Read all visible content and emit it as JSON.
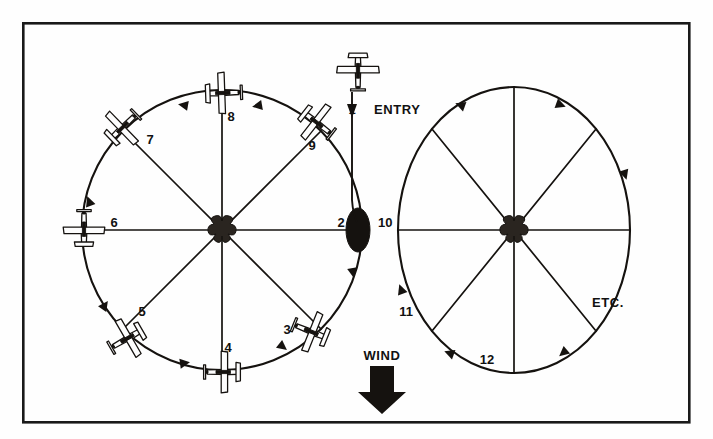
{
  "figure": {
    "background_color": "#fefefe",
    "ink_color": "#15120f",
    "frame": {
      "x": 22,
      "y": 22,
      "width": 668,
      "height": 401
    }
  },
  "labels": {
    "entry": "ENTRY",
    "wind": "WIND",
    "etc": "ETC."
  },
  "positions": [
    {
      "id": "1",
      "label": "1",
      "x": 352,
      "y": 109,
      "circle": "left",
      "has_aircraft": true,
      "heading": "south"
    },
    {
      "id": "2",
      "label": "2",
      "x": 341,
      "y": 222,
      "circle": "center",
      "has_aircraft": false,
      "heading": "south"
    },
    {
      "id": "3",
      "label": "3",
      "x": 287,
      "y": 330,
      "circle": "left",
      "has_aircraft": true,
      "heading": "west-northwest"
    },
    {
      "id": "4",
      "label": "4",
      "x": 226,
      "y": 348,
      "circle": "left",
      "has_aircraft": true,
      "heading": "west"
    },
    {
      "id": "5",
      "label": "5",
      "x": 142,
      "y": 312,
      "circle": "left",
      "has_aircraft": true,
      "heading": "west-southwest"
    },
    {
      "id": "6",
      "label": "6",
      "x": 114,
      "y": 222,
      "circle": "left",
      "has_aircraft": true,
      "heading": "north"
    },
    {
      "id": "7",
      "label": "7",
      "x": 146,
      "y": 139,
      "circle": "left",
      "has_aircraft": true,
      "heading": "east-northeast"
    },
    {
      "id": "8",
      "label": "8",
      "x": 229,
      "y": 117,
      "circle": "left",
      "has_aircraft": true,
      "heading": "east"
    },
    {
      "id": "9",
      "label": "9",
      "x": 311,
      "y": 145,
      "circle": "left",
      "has_aircraft": true,
      "heading": "east-southeast"
    },
    {
      "id": "10",
      "label": "10",
      "x": 376,
      "y": 222,
      "circle": "center",
      "has_aircraft": false,
      "heading": "south"
    },
    {
      "id": "11",
      "label": "11",
      "x": 404,
      "y": 312,
      "circle": "right",
      "has_aircraft": false,
      "heading": "east"
    },
    {
      "id": "12",
      "label": "12",
      "x": 484,
      "y": 360,
      "circle": "right",
      "has_aircraft": false,
      "heading": "east"
    }
  ],
  "circles": {
    "left": {
      "cx": 222,
      "cy": 230,
      "rx": 140,
      "ry": 140,
      "rotation_direction": "counterclockwise",
      "spokes": 8
    },
    "right": {
      "cx": 514,
      "cy": 230,
      "rx": 116,
      "ry": 143,
      "rotation_direction": "clockwise",
      "spokes": 8
    }
  },
  "entry_track": {
    "from_x": 352,
    "from_y": 92,
    "to_x": 352,
    "to_y": 215,
    "aircraft_x": 358,
    "aircraft_y": 70
  },
  "wind": {
    "label_x": 370,
    "label_y": 358,
    "arrow_x": 382,
    "arrow_y": 370,
    "direction": "down",
    "description": "Wind blowing from north to south"
  },
  "crossing_point": {
    "cx": 358,
    "cy": 230,
    "rx": 12,
    "ry": 22
  }
}
